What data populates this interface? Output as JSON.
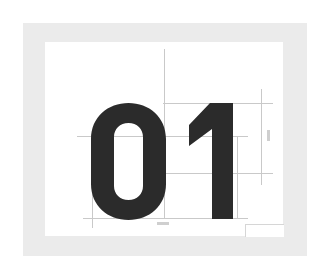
{
  "figure": {
    "glyph_text": "01",
    "colors": {
      "frame": "#ebebeb",
      "panel": "#ffffff",
      "glyph": "#2b2b2b",
      "guides": "#c9c9c9"
    },
    "guides": {
      "horizontal": [
        {
          "name": "cap-height-line",
          "x": 163,
          "y": 103,
          "w": 110
        },
        {
          "name": "x-height-line",
          "x": 77,
          "y": 136,
          "w": 171
        },
        {
          "name": "mid-line",
          "x": 165,
          "y": 173,
          "w": 108
        },
        {
          "name": "baseline",
          "x": 83,
          "y": 218,
          "w": 165
        }
      ],
      "vertical": [
        {
          "name": "center-guide",
          "x": 164,
          "y": 49,
          "h": 170
        },
        {
          "name": "left-guide",
          "x": 92,
          "y": 136,
          "h": 92
        },
        {
          "name": "right-guide",
          "x": 237,
          "y": 136,
          "h": 82
        },
        {
          "name": "dimension-guide",
          "x": 261,
          "y": 89,
          "h": 96
        }
      ]
    }
  }
}
